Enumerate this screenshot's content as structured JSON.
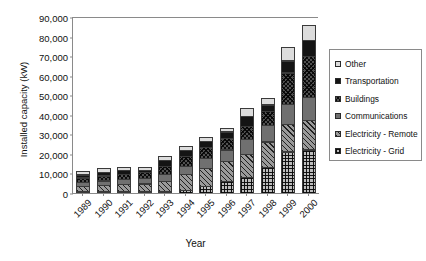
{
  "chart_data": {
    "type": "bar",
    "subtype": "stacked-bar",
    "title": "",
    "xlabel": "Year",
    "ylabel": "Installed capacity (kW)",
    "categories": [
      "1989",
      "1990",
      "1991",
      "1992",
      "1993",
      "1994",
      "1995",
      "1996",
      "1997",
      "1998",
      "1999",
      "2000"
    ],
    "ylim": [
      0,
      90000
    ],
    "yticks": [
      0,
      10000,
      20000,
      30000,
      40000,
      50000,
      60000,
      70000,
      80000,
      90000
    ],
    "ytick_labels": [
      "0",
      "10,000",
      "20,000",
      "30,000",
      "40,000",
      "50,000",
      "60,000",
      "70,000",
      "80,000",
      "90,000"
    ],
    "grid": false,
    "legend_position": "right",
    "stack_order_bottom_to_top": [
      "Electricity - Grid",
      "Electricity - Remote",
      "Communications",
      "Buildings",
      "Transportation",
      "Other"
    ],
    "series": [
      {
        "name": "Electricity - Grid",
        "pattern": "grid-dots",
        "values": [
          300,
          300,
          400,
          900,
          1100,
          1700,
          3900,
          6300,
          8500,
          13500,
          21500,
          22500
        ]
      },
      {
        "name": "Electricity - Remote",
        "pattern": "diagonal-hatch",
        "values": [
          3200,
          3600,
          4100,
          4400,
          5700,
          8500,
          9600,
          10600,
          12200,
          13500,
          14500,
          15500
        ]
      },
      {
        "name": "Communications",
        "pattern": "solid-gray",
        "values": [
          2300,
          2700,
          3000,
          3400,
          3900,
          4700,
          5500,
          6400,
          7800,
          8900,
          10500,
          12000
        ]
      },
      {
        "name": "Buildings",
        "pattern": "cross-hatch",
        "values": [
          2700,
          2900,
          3000,
          3100,
          4300,
          5200,
          5800,
          6100,
          7000,
          7500,
          16500,
          21500
        ]
      },
      {
        "name": "Transportation",
        "pattern": "solid-black",
        "values": [
          1900,
          2100,
          2300,
          1500,
          3400,
          3700,
          3600,
          3800,
          5500,
          3500,
          6500,
          8500
        ]
      },
      {
        "name": "Other",
        "pattern": "light-gray",
        "values": [
          2100,
          2400,
          2200,
          2000,
          2600,
          2200,
          2600,
          2300,
          4500,
          3600,
          7500,
          8000
        ]
      }
    ],
    "totals": [
      12500,
      14000,
      15000,
      15300,
      21000,
      26000,
      31000,
      35500,
      45500,
      50500,
      77000,
      88000
    ]
  },
  "legend": {
    "entries": [
      {
        "label": "Other"
      },
      {
        "label": "Transportation"
      },
      {
        "label": "Buildings"
      },
      {
        "label": "Communications"
      },
      {
        "label": "Electricity - Remote"
      },
      {
        "label": "Electricity - Grid"
      }
    ]
  }
}
